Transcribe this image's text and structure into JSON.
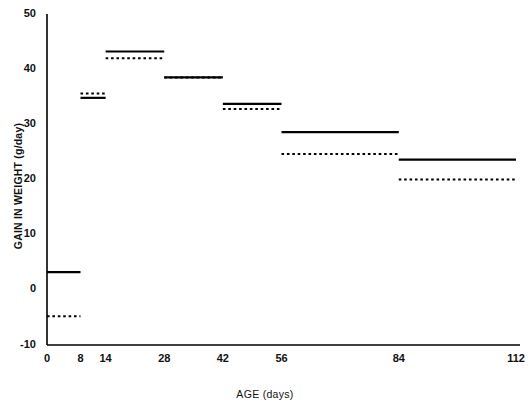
{
  "chart_data": {
    "type": "line",
    "title": "",
    "xlabel": "AGE (days)",
    "ylabel": "GAIN IN WEIGHT (g/day)",
    "xlim": [
      0,
      112
    ],
    "ylim": [
      -10,
      50
    ],
    "grid": false,
    "legend": "none",
    "xticks": [
      {
        "value": 0,
        "label": "0"
      },
      {
        "value": 8,
        "label": "8"
      },
      {
        "value": 14,
        "label": "14"
      },
      {
        "value": 28,
        "label": "28"
      },
      {
        "value": 42,
        "label": "42"
      },
      {
        "value": 56,
        "label": "56"
      },
      {
        "value": 84,
        "label": "84"
      },
      {
        "value": 112,
        "label": "112"
      }
    ],
    "yticks": [
      {
        "value": -10,
        "label": "-10"
      },
      {
        "value": 0,
        "label": "0"
      },
      {
        "value": 10,
        "label": "10"
      },
      {
        "value": 20,
        "label": "20"
      },
      {
        "value": 30,
        "label": "30"
      },
      {
        "value": 40,
        "label": "40"
      },
      {
        "value": 50,
        "label": "50"
      }
    ],
    "intervals": [
      {
        "x_start": 0,
        "x_end": 8
      },
      {
        "x_start": 8,
        "x_end": 14
      },
      {
        "x_start": 14,
        "x_end": 28
      },
      {
        "x_start": 28,
        "x_end": 42
      },
      {
        "x_start": 42,
        "x_end": 56
      },
      {
        "x_start": 56,
        "x_end": 84
      },
      {
        "x_start": 84,
        "x_end": 112
      }
    ],
    "series": [
      {
        "name": "solid",
        "style": "solid",
        "color": "#000000",
        "values": [
          3.2,
          34.8,
          43.2,
          38.5,
          33.7,
          28.6,
          23.6
        ]
      },
      {
        "name": "dashed",
        "style": "dashed",
        "color": "#000000",
        "values": [
          -4.8,
          35.6,
          42.0,
          38.5,
          32.8,
          24.6,
          20.0
        ]
      }
    ]
  },
  "axes": {
    "x_axis_color": "#000000",
    "y_axis_color": "#000000"
  }
}
